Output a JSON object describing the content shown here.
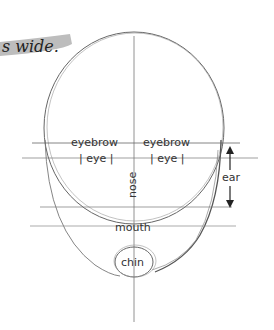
{
  "banner": {
    "text": "s wide.",
    "highlight_color": "#b9b9b9"
  },
  "labels": {
    "eyebrow_left": "eyebrow",
    "eyebrow_right": "eyebrow",
    "eye_left": "| eye |",
    "eye_right": "| eye |",
    "nose": "nose",
    "ear": "ear",
    "mouth": "mouth",
    "chin": "chin"
  },
  "colors": {
    "stroke": "#555555",
    "light_stroke": "#8a8a8a",
    "text": "#333333"
  }
}
